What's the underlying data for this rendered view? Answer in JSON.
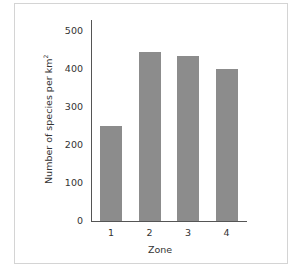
{
  "chart_data": {
    "type": "bar",
    "title": "",
    "xlabel": "Zone",
    "ylabel": "Number of species per km",
    "ylabel_superscript": "2",
    "categories": [
      "1",
      "2",
      "3",
      "4"
    ],
    "values": [
      250,
      445,
      435,
      400
    ],
    "ylim": [
      0,
      500
    ],
    "yticks": [
      "0",
      "100",
      "200",
      "300",
      "400",
      "500"
    ],
    "grid": false,
    "legend": null,
    "bar_color": "#8c8c8c"
  }
}
